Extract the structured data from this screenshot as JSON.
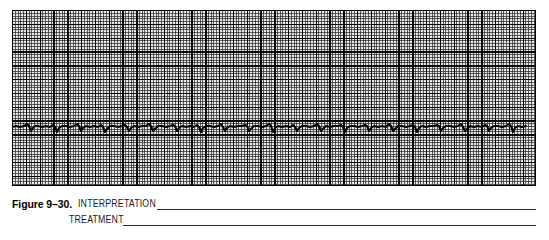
{
  "figure": {
    "number_label": "Figure 9–30.",
    "strip_alt": "ecg-rhythm-strip"
  },
  "caption": {
    "interpretation_label": "INTERPRETATION",
    "treatment_label": "TREATMENT"
  },
  "colors": {
    "grid_background": "#e8e8e8",
    "grid_fine_line": "#282828",
    "grid_bold_line": "#000000",
    "trace": "#000000",
    "rule": "#2b2b2b",
    "text": "#000000",
    "page_background": "#ffffff"
  },
  "chart_data": {
    "type": "line",
    "title": "",
    "xlabel": "",
    "ylabel": "",
    "grid": true,
    "legend": null,
    "axis": {
      "x_unit_per_small_box_sec": 0.04,
      "x_unit_per_large_box_sec": 0.2,
      "y_unit_per_small_box_mv": 0.1,
      "y_unit_per_large_box_mv": 0.5
    },
    "layout": {
      "strip_x": 12,
      "strip_y": 10,
      "strip_width": 524,
      "strip_height": 176,
      "small_box_px": 2.76,
      "large_box_px": 13.8,
      "baseline_y_px": 117
    },
    "baseline_y": 117,
    "x": [
      0,
      4,
      8,
      12,
      15,
      17,
      19,
      21,
      23,
      26,
      30,
      34,
      38,
      41,
      43,
      45,
      47,
      50,
      54,
      58,
      62,
      65,
      67,
      69,
      71,
      74,
      78,
      82,
      86,
      89,
      91,
      93,
      95,
      98,
      102,
      106,
      110,
      113,
      115,
      117,
      119,
      122,
      126,
      130,
      134,
      137,
      139,
      141,
      143,
      146,
      150,
      154,
      158,
      161,
      163,
      165,
      167,
      170,
      174,
      178,
      182,
      185,
      187,
      189,
      191,
      194,
      198,
      202,
      206,
      209,
      211,
      213,
      215,
      218,
      222,
      226,
      230,
      233,
      235,
      237,
      239,
      242,
      246,
      250,
      254,
      257,
      259,
      261,
      263,
      266,
      270,
      274,
      278,
      281,
      283,
      285,
      287,
      290,
      294,
      298,
      302,
      305,
      307,
      309,
      311,
      314,
      318,
      322,
      326,
      329,
      331,
      333,
      335,
      338,
      342,
      346,
      350,
      353,
      355,
      357,
      359,
      362,
      366,
      370,
      374,
      377,
      379,
      381,
      383,
      386,
      390,
      394,
      398,
      401,
      403,
      405,
      407,
      410,
      414,
      418,
      422,
      425,
      427,
      429,
      431,
      434,
      438,
      442,
      446,
      449,
      451,
      453,
      455,
      458,
      462,
      466,
      470,
      473,
      475,
      477,
      479,
      482,
      486,
      490,
      494,
      497,
      499,
      501,
      503,
      506,
      510,
      514,
      518,
      521,
      524
    ],
    "y": [
      117,
      116,
      117,
      116,
      114,
      116,
      121,
      118,
      116,
      116,
      117,
      116,
      117,
      115,
      117,
      122,
      118,
      116,
      116,
      117,
      116,
      114,
      116,
      121,
      118,
      116,
      117,
      116,
      117,
      115,
      117,
      122,
      119,
      116,
      116,
      117,
      116,
      115,
      117,
      121,
      118,
      116,
      117,
      116,
      116,
      114,
      116,
      121,
      119,
      116,
      116,
      117,
      116,
      115,
      116,
      121,
      118,
      116,
      117,
      116,
      117,
      115,
      117,
      122,
      118,
      116,
      116,
      117,
      116,
      114,
      117,
      121,
      118,
      116,
      117,
      116,
      116,
      115,
      116,
      121,
      119,
      116,
      116,
      117,
      116,
      114,
      116,
      122,
      118,
      116,
      117,
      116,
      117,
      115,
      117,
      121,
      118,
      116,
      116,
      117,
      116,
      114,
      116,
      121,
      119,
      116,
      117,
      116,
      116,
      115,
      117,
      122,
      118,
      116,
      116,
      117,
      116,
      115,
      116,
      121,
      118,
      116,
      117,
      116,
      117,
      114,
      116,
      121,
      119,
      116,
      116,
      117,
      116,
      115,
      117,
      122,
      118,
      116,
      117,
      116,
      116,
      115,
      116,
      121,
      118,
      116,
      116,
      117,
      116,
      114,
      117,
      121,
      119,
      116,
      117,
      116,
      117,
      115,
      116,
      121,
      118,
      116,
      116,
      117,
      116,
      114,
      116,
      122,
      118,
      116,
      117,
      116
    ]
  }
}
